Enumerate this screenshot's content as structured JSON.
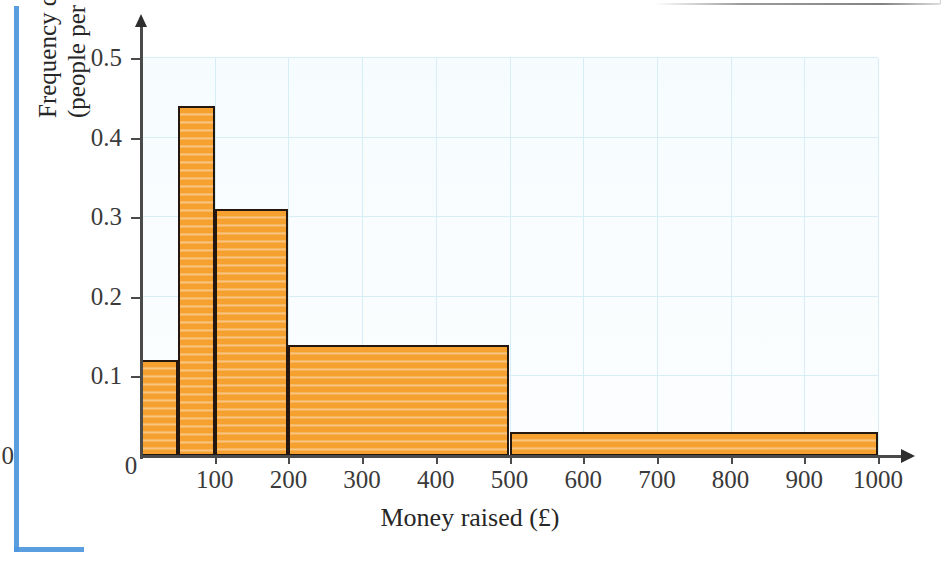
{
  "figure": {
    "kind": "histogram",
    "background_color": "#ffffff",
    "bar_fill_color": "#f5a02f",
    "bar_outline_color": "#231710",
    "gridline_color": "#d8eef6",
    "axis_color": "#4a4a4a",
    "page_marker_color": "#4d96dd"
  },
  "axis_titles": {
    "x": "Money raised (£)",
    "y_line1": "Frequency density",
    "y_line2": "(people per £)"
  },
  "chart_data": {
    "type": "bar",
    "title": "",
    "xlabel": "Money raised (£)",
    "ylabel": "Frequency density (people per £)",
    "xlim": [
      0,
      1000
    ],
    "ylim": [
      0,
      0.5
    ],
    "grid": true,
    "legend": "none",
    "x_ticks": [
      0,
      100,
      200,
      300,
      400,
      500,
      600,
      700,
      800,
      900,
      1000
    ],
    "x_tick_labels": [
      "0",
      "100",
      "200",
      "300",
      "400",
      "500",
      "600",
      "700",
      "800",
      "900",
      "1000"
    ],
    "y_ticks": [
      0,
      0.1,
      0.2,
      0.3,
      0.4,
      0.5
    ],
    "y_tick_labels": [
      "0",
      "0.1",
      "0.2",
      "0.3",
      "0.4",
      "0.5"
    ],
    "bins": [
      {
        "label": "0–50",
        "x_start": 0,
        "x_end": 50,
        "value": 0.12
      },
      {
        "label": "50–100",
        "x_start": 50,
        "x_end": 100,
        "value": 0.44
      },
      {
        "label": "100–200",
        "x_start": 100,
        "x_end": 200,
        "value": 0.31
      },
      {
        "label": "200–500",
        "x_start": 200,
        "x_end": 500,
        "value": 0.14
      },
      {
        "label": "500–1000",
        "x_start": 500,
        "x_end": 1000,
        "value": 0.03
      }
    ],
    "categories": [
      "0–50",
      "50–100",
      "100–200",
      "200–500",
      "500–1000"
    ],
    "values": [
      0.12,
      0.44,
      0.31,
      0.14,
      0.03
    ]
  }
}
